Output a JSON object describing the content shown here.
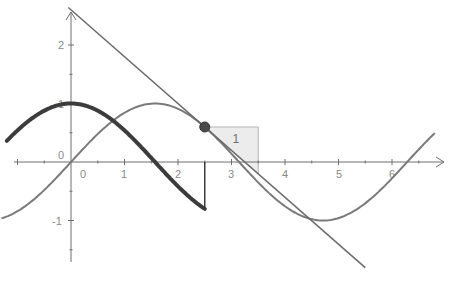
{
  "chart_data": {
    "type": "line",
    "title": "",
    "xlabel": "",
    "ylabel": "",
    "xlim": [
      -1.3,
      6.8
    ],
    "ylim": [
      -1.75,
      2.6
    ],
    "grid": false,
    "x_ticks": [
      "0",
      "1",
      "2",
      "3",
      "4",
      "5",
      "6"
    ],
    "y_ticks": [
      "2",
      "1",
      "0",
      "-1"
    ],
    "origin_label": "0",
    "series": [
      {
        "name": "f(x) = sin(x)",
        "style": "thin gray",
        "x_range": [
          -1.3,
          6.8
        ]
      },
      {
        "name": "f'(x) = cos(x)",
        "style": "thick dark",
        "x_range": [
          -1.2,
          2.5
        ],
        "end_point": [
          2.5,
          -0.8
        ]
      },
      {
        "name": "tangent at x=2.5",
        "style": "thin gray line",
        "point": [
          2.5,
          0.6
        ],
        "slope": -0.8
      }
    ],
    "annotations": [
      {
        "type": "point",
        "x": 2.5,
        "y": 0.6,
        "label": ""
      },
      {
        "type": "slope-triangle",
        "x_from": 2.5,
        "x_to": 3.5,
        "label": "1"
      },
      {
        "type": "vertical-segment",
        "x": 2.5,
        "y_from": 0,
        "y_to": -0.8
      }
    ]
  },
  "labels": {
    "x": [
      "0",
      "1",
      "2",
      "3",
      "4",
      "5",
      "6"
    ],
    "y2": "2",
    "y1": "1",
    "ym1": "-1",
    "origin": "0",
    "triangle": "1"
  },
  "colors": {
    "axis": "#6e6e6e",
    "sin": "#7a7a7a",
    "cos": "#3c3c3c",
    "tangent": "#6a6a6a",
    "point": "#4a4a4a",
    "triangle_fill": "#ececec",
    "triangle_stroke": "#b5b5b5"
  }
}
